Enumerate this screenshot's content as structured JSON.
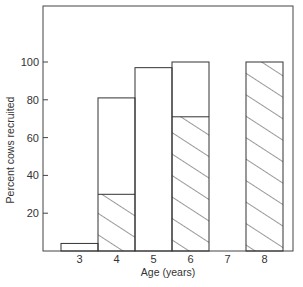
{
  "chart_data": {
    "type": "bar",
    "title": "",
    "xlabel": "Age (years)",
    "ylabel": "Percent cows recruited",
    "categories": [
      "3",
      "4",
      "5",
      "6",
      "7",
      "8"
    ],
    "series": [
      {
        "name": "Total recruited (open bar height)",
        "pattern": "open",
        "values": [
          4,
          81,
          97,
          100,
          null,
          100
        ]
      },
      {
        "name": "Hatched portion",
        "pattern": "hatched",
        "values": [
          0,
          30,
          0,
          71,
          null,
          100
        ]
      }
    ],
    "yticks": [
      20,
      40,
      60,
      80,
      100
    ],
    "ylim": [
      0,
      133
    ],
    "grid": false,
    "legend": null,
    "colors": {
      "line": "#333333",
      "background": "#ffffff"
    }
  }
}
